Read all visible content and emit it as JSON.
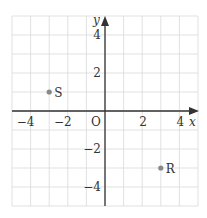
{
  "plane": {
    "x_min": -5,
    "x_max": 5,
    "y_min": -5,
    "y_max": 5,
    "axis_x_label": "x",
    "axis_y_label": "y",
    "origin_label": "O",
    "x_ticks": [
      {
        "v": -4,
        "t": "−4"
      },
      {
        "v": -2,
        "t": "−2"
      },
      {
        "v": 2,
        "t": "2"
      },
      {
        "v": 4,
        "t": "4"
      }
    ],
    "y_ticks": [
      {
        "v": 4,
        "t": "4"
      },
      {
        "v": 2,
        "t": "2"
      },
      {
        "v": -2,
        "t": "−2"
      },
      {
        "v": -4,
        "t": "−4"
      }
    ]
  },
  "points": [
    {
      "label": "S",
      "x": -3,
      "y": 1
    },
    {
      "label": "R",
      "x": 3,
      "y": -3
    }
  ],
  "colors": {
    "grid": "#d9d9d9",
    "axis": "#333333",
    "point": "#888888",
    "text": "#333333"
  }
}
